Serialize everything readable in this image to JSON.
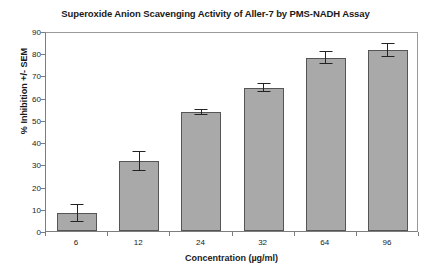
{
  "chart_data": {
    "type": "bar",
    "title": "Superoxide Anion Scavenging Activity of Aller-7 by PMS-NADH Assay",
    "xlabel": "Concentration (µg/ml)",
    "ylabel": "% Inhibition +/- SEM",
    "categories": [
      "6",
      "12",
      "24",
      "32",
      "64",
      "96"
    ],
    "values": [
      8,
      31.5,
      53.5,
      64.5,
      78,
      81.5
    ],
    "errors": [
      4,
      4.5,
      1.5,
      2,
      3,
      3
    ],
    "ylim": [
      0,
      90
    ],
    "yticks": [
      0,
      10,
      20,
      30,
      40,
      50,
      60,
      70,
      80,
      90
    ],
    "ytick_labels": [
      "0",
      "10",
      "20",
      "30",
      "40",
      "50",
      "60",
      "70",
      "80",
      "90"
    ],
    "grid": false,
    "legend": "none",
    "bar_color": "#a9a9a9",
    "bar_edge_color": "#555555",
    "error_color": "#232323",
    "axis_color": "#7d7d7d",
    "text_color": "#1a1a1a"
  }
}
